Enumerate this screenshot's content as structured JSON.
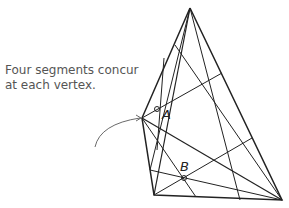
{
  "caption": {
    "line1": "Four segments concur",
    "line2": "at each vertex."
  },
  "points": {
    "A": "A",
    "B": "B"
  },
  "colors": {
    "lines": "#222222",
    "caption": "#555555"
  }
}
